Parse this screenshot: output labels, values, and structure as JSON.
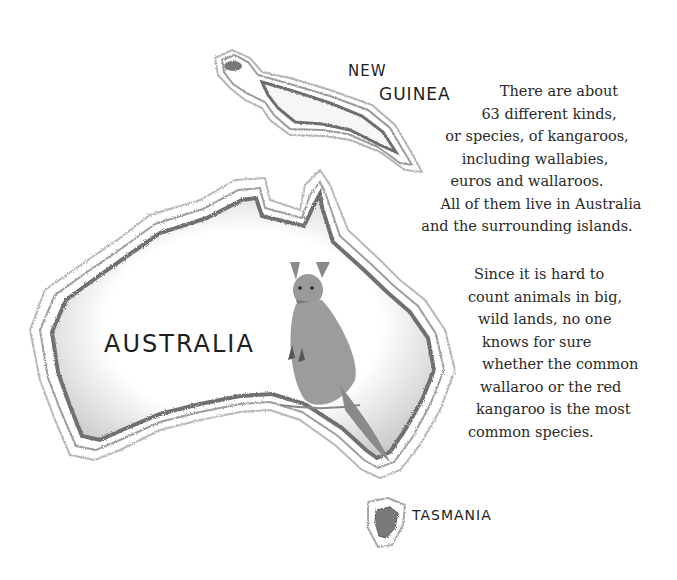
{
  "labels": {
    "new_guinea_line1": "NEW",
    "new_guinea_line2": "GUINEA",
    "australia": "AUSTRALIA",
    "tasmania": "TASMANIA"
  },
  "text": {
    "paragraph1": [
      "There are about",
      "63 different kinds,",
      "or species, of kangaroos,",
      "including wallabies,",
      "euros and wallaroos.",
      "All of them live in Australia",
      "and the surrounding islands."
    ],
    "paragraph2": [
      "Since it is hard to",
      "count animals in big,",
      "wild lands, no one",
      "knows for sure",
      "whether the common",
      "wallaroo or the red",
      "kangaroo is the most",
      "common species."
    ]
  },
  "colors": {
    "background": "#ffffff",
    "ink": "#2a2a2a",
    "shading": "#8a8a8a"
  },
  "icons": {
    "illustration": "kangaroo-illustration"
  }
}
